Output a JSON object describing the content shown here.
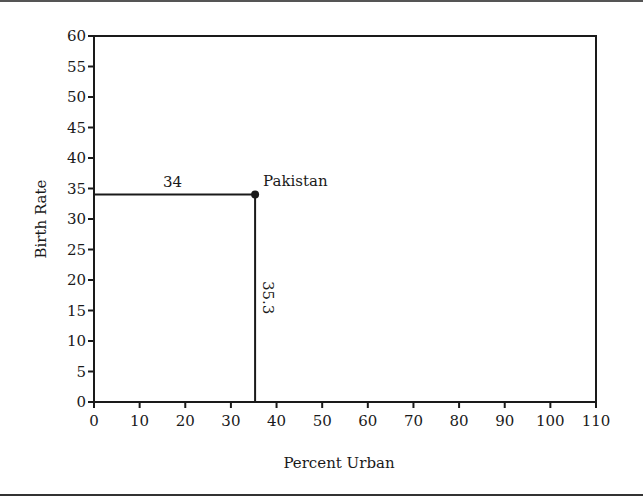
{
  "chart_data": {
    "type": "scatter",
    "title": "",
    "xlabel": "Percent Urban",
    "ylabel": "Birth Rate",
    "xlim": [
      0,
      110
    ],
    "ylim": [
      0,
      60
    ],
    "x_ticks": [
      0,
      10,
      20,
      30,
      40,
      50,
      60,
      70,
      80,
      90,
      100,
      110
    ],
    "y_ticks": [
      0,
      5,
      10,
      15,
      20,
      25,
      30,
      35,
      40,
      45,
      50,
      55,
      60
    ],
    "grid": false,
    "legend": null,
    "series": [
      {
        "name": "Pakistan",
        "points": [
          {
            "x": 35.3,
            "y": 34,
            "label": "Pakistan"
          }
        ]
      }
    ],
    "annotations": [
      {
        "text": "34",
        "description": "horizontal guide line from y-axis to point at birth rate 34"
      },
      {
        "text": "35.3",
        "description": "vertical guide line from x-axis to point at percent urban 35.3 (rotated label)"
      },
      {
        "text": "Pakistan",
        "description": "point label"
      }
    ]
  },
  "labels": {
    "xlabel": "Percent Urban",
    "ylabel": "Birth Rate",
    "point_label": "Pakistan",
    "h_value": "34",
    "v_value": "35.3"
  }
}
